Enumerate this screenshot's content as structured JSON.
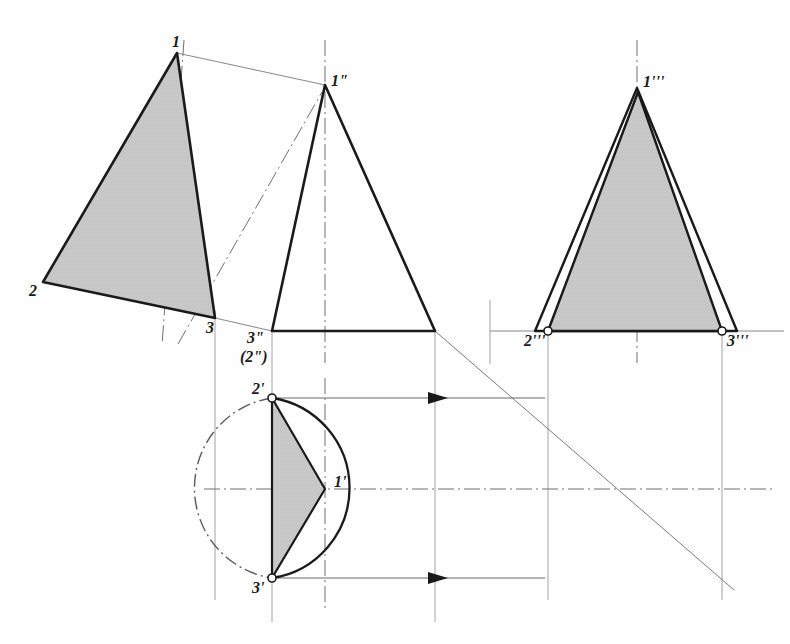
{
  "figure": {
    "kind": "orthographic-projection-drawing",
    "background_color": "#fefefe",
    "line_color": "#1a1a1a",
    "thin_line_color": "#555555",
    "shade_fill": "#c9c9c9",
    "shade_stroke": "#1a1a1a"
  },
  "labels": [
    {
      "id": "v1",
      "text": "1",
      "x": 172,
      "y": 34,
      "size": "md"
    },
    {
      "id": "v2",
      "text": "2",
      "x": 29,
      "y": 283,
      "size": "md"
    },
    {
      "id": "v3",
      "text": "3",
      "x": 206,
      "y": 320,
      "size": "md"
    },
    {
      "id": "v1pp",
      "text": "1\"",
      "x": 331,
      "y": 73,
      "size": "md"
    },
    {
      "id": "v3pp",
      "text": "3\"",
      "x": 247,
      "y": 330,
      "size": "md"
    },
    {
      "id": "v2pp",
      "text": "(2\")",
      "x": 240,
      "y": 349,
      "size": "md"
    },
    {
      "id": "v2p",
      "text": "2'",
      "x": 252,
      "y": 381,
      "size": "md"
    },
    {
      "id": "v1p",
      "text": "1'",
      "x": 334,
      "y": 474,
      "size": "md"
    },
    {
      "id": "v3p",
      "text": "3'",
      "x": 252,
      "y": 580,
      "size": "md"
    },
    {
      "id": "v1ppp",
      "text": "1'''",
      "x": 643,
      "y": 74,
      "size": "md"
    },
    {
      "id": "v2ppp",
      "text": "2'''",
      "x": 524,
      "y": 333,
      "size": "md"
    },
    {
      "id": "v3ppp",
      "text": "3'''",
      "x": 727,
      "y": 333,
      "size": "md"
    }
  ],
  "views": {
    "true_shape": {
      "name": "rotated true-shape triangle",
      "vertices": {
        "p1": [
          177,
          53
        ],
        "p2": [
          43,
          282
        ],
        "p3": [
          215,
          318
        ]
      },
      "shaded": true,
      "axis_line": [
        [
          164,
          340
        ],
        [
          184,
          44
        ]
      ]
    },
    "front_elevation": {
      "name": "front view cone outline",
      "apex": [
        325,
        85
      ],
      "base_left": [
        272,
        331
      ],
      "base_right": [
        435,
        331
      ],
      "shaded": false,
      "center_line": [
        [
          325,
          42
        ],
        [
          325,
          360
        ]
      ]
    },
    "side_view": {
      "name": "side view with inner shaded triangle",
      "outer": {
        "apex": [
          637,
          88
        ],
        "base_left": [
          535,
          331
        ],
        "base_right": [
          737,
          331
        ]
      },
      "inner": {
        "apex": [
          638,
          92
        ],
        "base_left": [
          548,
          331
        ],
        "base_right": [
          722,
          331
        ]
      },
      "shaded": true,
      "center_line": [
        [
          637,
          42
        ],
        [
          637,
          360
        ]
      ]
    },
    "plan_view": {
      "name": "plan view circle with shaded triangle",
      "center": [
        325,
        489
      ],
      "radius": 91,
      "visible_arc_start_deg": -90,
      "visible_arc_end_deg": 90,
      "hidden_arc_style": "dash-dot",
      "triangle": {
        "p1": [
          325,
          489
        ],
        "p2": [
          272,
          398
        ],
        "p3": [
          272,
          578
        ]
      },
      "shaded": true,
      "h_center_line": [
        [
          205,
          489
        ],
        [
          770,
          489
        ]
      ],
      "v_center_line": [
        [
          325,
          380
        ],
        [
          325,
          610
        ]
      ]
    },
    "miter_line": {
      "name": "45 degree projection miter line",
      "from": [
        435,
        331
      ],
      "to": [
        732,
        588
      ]
    }
  },
  "projection_lines": {
    "thin_solid": [
      [
        [
          177,
          53
        ],
        [
          325,
          85
        ]
      ],
      [
        [
          215,
          318
        ],
        [
          272,
          331
        ]
      ],
      [
        [
          490,
          331
        ],
        [
          782,
          331
        ]
      ],
      [
        [
          205,
          489
        ],
        [
          770,
          489
        ]
      ]
    ],
    "verticals": [
      [
        [
          215,
          318
        ],
        [
          215,
          600
        ]
      ],
      [
        [
          272,
          331
        ],
        [
          272,
          620
        ]
      ],
      [
        [
          435,
          331
        ],
        [
          435,
          620
        ]
      ],
      [
        [
          490,
          300
        ],
        [
          490,
          360
        ]
      ],
      [
        [
          548,
          331
        ],
        [
          548,
          600
        ]
      ],
      [
        [
          722,
          331
        ],
        [
          722,
          600
        ]
      ]
    ],
    "horizontals_with_arrow": [
      {
        "from": [
          272,
          398
        ],
        "to": [
          548,
          398
        ],
        "arrow_at": [
          440,
          398
        ]
      },
      {
        "from": [
          272,
          578
        ],
        "to": [
          548,
          578
        ],
        "arrow_at": [
          440,
          578
        ]
      }
    ],
    "dash_dot": [
      [
        [
          178,
          344
        ],
        [
          321,
          92
        ]
      ]
    ]
  },
  "markers": {
    "open_circles": [
      [
        272,
        398
      ],
      [
        272,
        578
      ],
      [
        548,
        331
      ],
      [
        722,
        331
      ]
    ],
    "radius": 4,
    "fill": "#ffffff",
    "stroke": "#1a1a1a"
  }
}
